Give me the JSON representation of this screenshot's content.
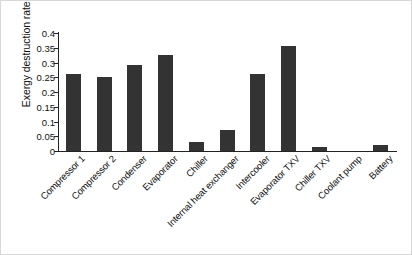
{
  "chart_data": {
    "type": "bar",
    "title": "",
    "xlabel": "",
    "ylabel": "Exergy destruction rate (kW)",
    "ylim": [
      0,
      0.4
    ],
    "ytick_labels": [
      "0.4",
      "0.35",
      "0.3",
      "0.25",
      "0.2",
      "0.15",
      "0.1",
      "0.05",
      "0"
    ],
    "ytick_values": [
      0.4,
      0.35,
      0.3,
      0.25,
      0.2,
      0.15,
      0.1,
      0.05,
      0
    ],
    "grid": false,
    "legend": null,
    "bar_color": "#333333",
    "categories": [
      "Compressor 1",
      "Compressor 2",
      "Condenser",
      "Evaporator",
      "Chiller",
      "Internal heat exchanger",
      "Intercooler",
      "Evaporator TXV",
      "Chiller TXV",
      "Coolant pump",
      "Battery"
    ],
    "values": [
      0.26,
      0.25,
      0.29,
      0.325,
      0.03,
      0.07,
      0.26,
      0.355,
      0.015,
      0.0,
      0.02
    ]
  }
}
